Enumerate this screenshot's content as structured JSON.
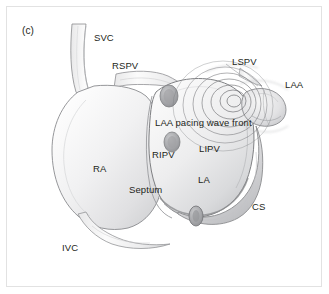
{
  "figure": {
    "panel_letter": "(c)",
    "background_color": "#ffffff",
    "frame_color": "#e2e2e2",
    "text_color": "#231f20",
    "ink_color": "#6d6e71",
    "type": "anatomical-illustration"
  },
  "labels": [
    {
      "id": "svc",
      "text": "SVC",
      "x": 94,
      "y": 33
    },
    {
      "id": "rspv",
      "text": "RSPV",
      "x": 112,
      "y": 61
    },
    {
      "id": "lspv",
      "text": "LSPV",
      "x": 232,
      "y": 57
    },
    {
      "id": "laa",
      "text": "LAA",
      "x": 285,
      "y": 80
    },
    {
      "id": "wavefront",
      "text": "LAA pacing wave front",
      "x": 155,
      "y": 118
    },
    {
      "id": "lipv",
      "text": "LIPV",
      "x": 199,
      "y": 144
    },
    {
      "id": "ripv",
      "text": "RIPV",
      "x": 152,
      "y": 150
    },
    {
      "id": "ra",
      "text": "RA",
      "x": 93,
      "y": 164
    },
    {
      "id": "la",
      "text": "LA",
      "x": 198,
      "y": 175
    },
    {
      "id": "septum",
      "text": "Septum",
      "x": 129,
      "y": 185
    },
    {
      "id": "cs",
      "text": "CS",
      "x": 252,
      "y": 202
    },
    {
      "id": "ivc",
      "text": "IVC",
      "x": 62,
      "y": 243
    }
  ],
  "structures": {
    "right_atrium": "RA",
    "left_atrium": "LA",
    "superior_vena_cava": "SVC",
    "inferior_vena_cava": "IVC",
    "right_superior_pulmonary_vein": "RSPV",
    "right_inferior_pulmonary_vein": "RIPV",
    "left_superior_pulmonary_vein": "LSPV",
    "left_inferior_pulmonary_vein": "LIPV",
    "left_atrial_appendage": "LAA",
    "coronary_sinus": "CS",
    "interatrial_septum": "Septum",
    "wave_front_rings": 7
  }
}
